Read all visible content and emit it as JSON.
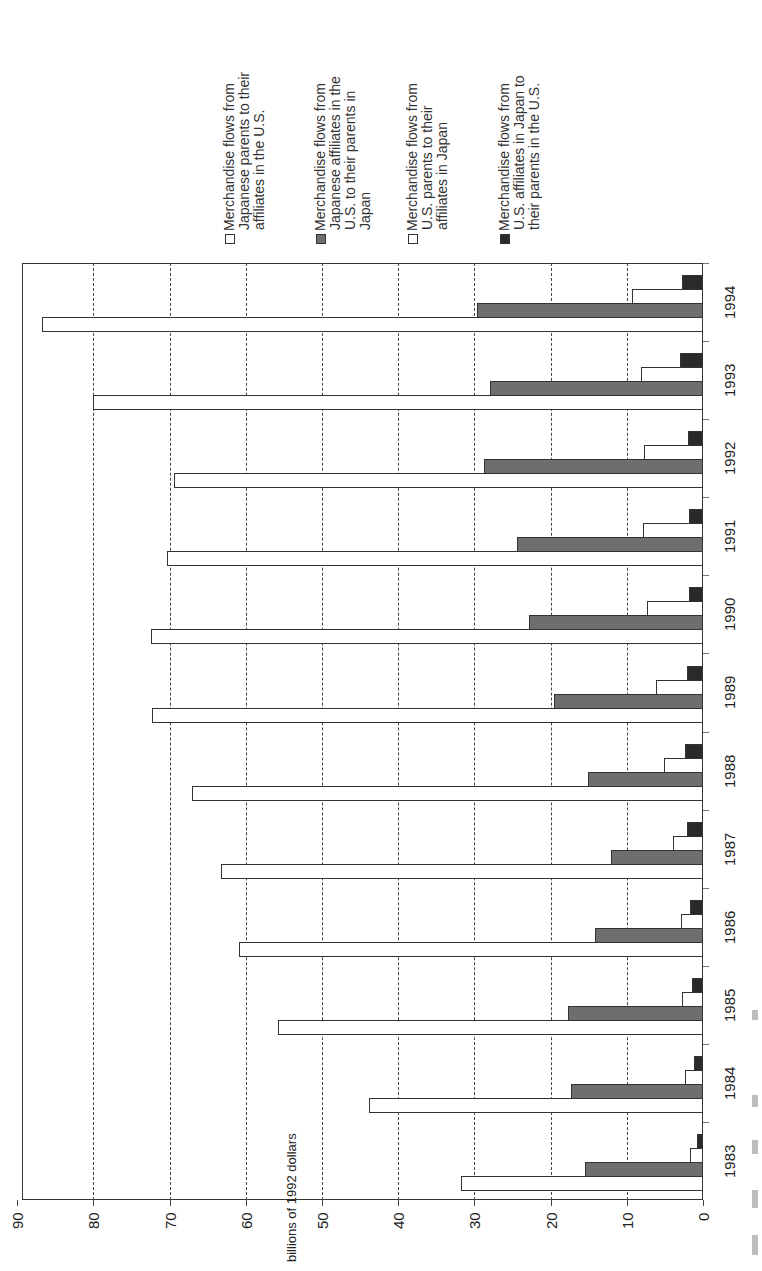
{
  "chart_data": {
    "type": "bar",
    "orientation": "rotated 90 degrees counter-clockwise (bars extend leftward from baseline)",
    "title": "",
    "xlabel": "",
    "ylabel": "billions of 1992 dollars",
    "ylim": [
      0,
      90
    ],
    "yticks": [
      0,
      10,
      20,
      30,
      40,
      50,
      60,
      70,
      80,
      90
    ],
    "grid": "dashed lines at each y tick",
    "legend_position": "top (rotated text)",
    "categories": [
      "1983",
      "1984",
      "1985",
      "1986",
      "1987",
      "1988",
      "1989",
      "1990",
      "1991",
      "1992",
      "1993",
      "1994"
    ],
    "series": [
      {
        "name": "Merchandise flows from Japanese parents to their affiliates in the U.S.",
        "fill": "white",
        "values": [
          31.7,
          43.8,
          55.8,
          60.9,
          63.2,
          67.1,
          72.3,
          72.5,
          70.4,
          69.4,
          80.1,
          86.8
        ]
      },
      {
        "name": "Merchandise flows from Japanese affiliates in the U.S. to their parents in Japan",
        "fill": "gray",
        "values": [
          15.5,
          17.3,
          17.7,
          14.2,
          12.1,
          15.1,
          19.5,
          22.8,
          24.4,
          28.7,
          27.9,
          29.6
        ]
      },
      {
        "name": "Merchandise flows from U.S. parents to their affiliates in Japan",
        "fill": "white",
        "values": [
          1.7,
          2.3,
          2.7,
          2.9,
          3.9,
          5.1,
          6.2,
          7.4,
          7.9,
          7.7,
          8.2,
          9.3
        ]
      },
      {
        "name": "Merchandise flows from U.S. affiliates in Japan to their parents in the U.S.",
        "fill": "black",
        "values": [
          0.8,
          1.2,
          1.5,
          1.7,
          2.1,
          2.3,
          2.1,
          1.8,
          1.8,
          2.0,
          3.0,
          2.7
        ]
      }
    ]
  },
  "legend": [
    {
      "lines": [
        "Merchandise flows from",
        "Japanese parents to their",
        "affiliates in the U.S."
      ],
      "swatch": "white"
    },
    {
      "lines": [
        "Merchandise flows from",
        "Japanese affiliates in the",
        "U.S. to their parents in",
        "Japan"
      ],
      "swatch": "gray"
    },
    {
      "lines": [
        "Merchandise flows from",
        "U.S. parents to their",
        "affiliates in Japan"
      ],
      "swatch": "white"
    },
    {
      "lines": [
        "Merchandise flows from",
        "U.S. affiliates in Japan to",
        "their parents in the U.S."
      ],
      "swatch": "black"
    }
  ],
  "colors": {
    "white": "#ffffff",
    "gray": "#6e6e6e",
    "black": "#2a2a2a",
    "frame": "#333333"
  }
}
